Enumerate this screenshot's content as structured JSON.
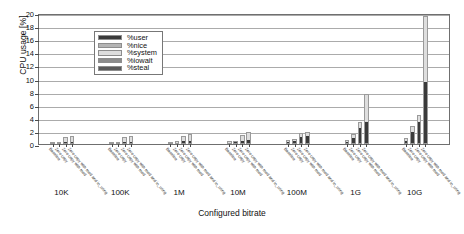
{
  "chart_data": {
    "type": "bar",
    "title": "",
    "subtitle": "",
    "xlabel": "Configured bitrate",
    "ylabel": "CPU usage [%]",
    "ylim": [
      0,
      20
    ],
    "yticks": [
      0,
      2,
      4,
      6,
      8,
      10,
      12,
      14,
      16,
      18,
      20
    ],
    "grid": "horizontal",
    "stacked": true,
    "legend_position": "top-left",
    "legend": [
      "%user",
      "%nice",
      "%system",
      "%iowait",
      "%steal"
    ],
    "categories": [
      "10K",
      "100K",
      "1M",
      "10M",
      "100M",
      "1G",
      "10G"
    ],
    "subcategories": [
      "Baseline",
      "Zero copy",
      "Zero copy with mod",
      "Zero copy with mod and io_uring"
    ],
    "series": [
      {
        "name": "%user",
        "color": "#3a3a3a",
        "values": [
          [
            0.15,
            0.15,
            0.35,
            0.35
          ],
          [
            0.15,
            0.15,
            0.35,
            0.35
          ],
          [
            0.15,
            0.2,
            0.45,
            0.5
          ],
          [
            0.2,
            0.25,
            0.5,
            0.6
          ],
          [
            0.3,
            0.4,
            1.1,
            1.2
          ],
          [
            0.3,
            0.9,
            2.4,
            3.3
          ],
          [
            0.4,
            1.9,
            3.3,
            9.4
          ]
        ]
      },
      {
        "name": "%nice",
        "color": "#b4b4b4",
        "values": [
          [
            0.0,
            0.0,
            0.0,
            0.0
          ],
          [
            0.0,
            0.0,
            0.0,
            0.0
          ],
          [
            0.0,
            0.0,
            0.0,
            0.0
          ],
          [
            0.0,
            0.0,
            0.0,
            0.0
          ],
          [
            0.0,
            0.0,
            0.0,
            0.0
          ],
          [
            0.0,
            0.0,
            0.0,
            0.0
          ],
          [
            0.0,
            0.0,
            0.0,
            0.0
          ]
        ]
      },
      {
        "name": "%system",
        "color": "#dedede",
        "values": [
          [
            0.1,
            0.1,
            0.75,
            0.85
          ],
          [
            0.1,
            0.1,
            0.75,
            0.9
          ],
          [
            0.15,
            0.2,
            0.8,
            1.1
          ],
          [
            0.2,
            0.25,
            0.9,
            1.25
          ],
          [
            0.25,
            0.3,
            0.55,
            0.6
          ],
          [
            0.35,
            0.6,
            1.0,
            4.3
          ],
          [
            0.5,
            0.9,
            1.1,
            10.1
          ]
        ]
      },
      {
        "name": "%iowait",
        "color": "#8c8c8c",
        "values": [
          [
            0.0,
            0.0,
            0.0,
            0.0
          ],
          [
            0.0,
            0.0,
            0.0,
            0.0
          ],
          [
            0.0,
            0.0,
            0.0,
            0.0
          ],
          [
            0.0,
            0.0,
            0.0,
            0.0
          ],
          [
            0.0,
            0.0,
            0.0,
            0.0
          ],
          [
            0.0,
            0.0,
            0.0,
            0.0
          ],
          [
            0.0,
            0.0,
            0.0,
            0.0
          ]
        ]
      },
      {
        "name": "%steal",
        "color": "#5a5a5a",
        "values": [
          [
            0.0,
            0.0,
            0.0,
            0.0
          ],
          [
            0.0,
            0.0,
            0.0,
            0.0
          ],
          [
            0.0,
            0.0,
            0.0,
            0.0
          ],
          [
            0.0,
            0.0,
            0.0,
            0.0
          ],
          [
            0.0,
            0.0,
            0.0,
            0.0
          ],
          [
            0.0,
            0.0,
            0.0,
            0.0
          ],
          [
            0.0,
            0.0,
            0.0,
            0.0
          ]
        ]
      }
    ]
  }
}
